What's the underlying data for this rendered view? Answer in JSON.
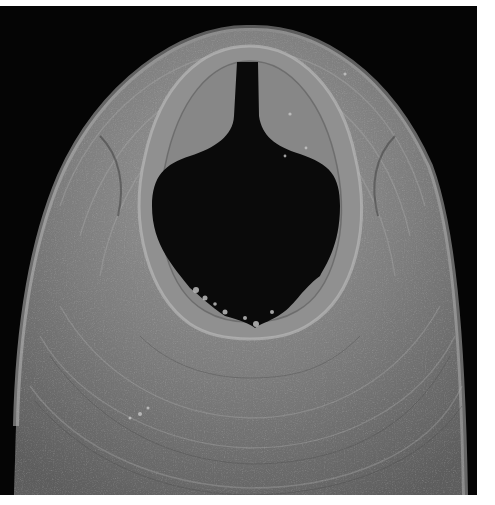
{
  "image": {
    "kind": "scanning electron micrograph",
    "subject": "nematode (worm) anterior end with open buccal cavity",
    "background_color": "#050505",
    "specimen_color": "#8a8a8a",
    "opening_color": "#0a0a0a",
    "margin_color": "#ffffff"
  }
}
